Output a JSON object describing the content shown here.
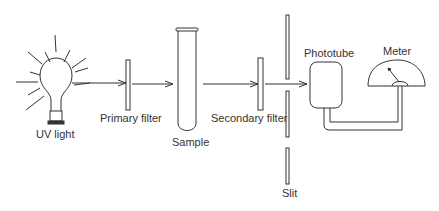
{
  "diagram": {
    "labels": {
      "uv_light": "UV light",
      "primary_filter": "Primary filter",
      "sample": "Sample",
      "secondary_filter": "Secondary filter",
      "phototube": "Phototube",
      "meter": "Meter",
      "slit": "Slit"
    },
    "stroke_color": "#333333"
  }
}
